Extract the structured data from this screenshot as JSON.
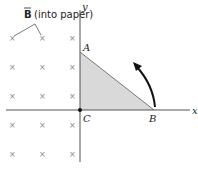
{
  "field_label": {
    "vector": "B",
    "text": "(into paper)"
  },
  "axes": {
    "x_label": "x",
    "y_label": "y"
  },
  "points": {
    "A": "A",
    "B": "B",
    "C": "C"
  },
  "field_marks": {
    "symbol": "×",
    "columns_x": [
      12,
      42,
      72
    ],
    "rows_y": [
      38,
      67,
      96,
      125,
      154
    ]
  },
  "colors": {
    "triangle_fill": "#d9d9d9",
    "axis": "#555555",
    "edge": "#777777",
    "arrow": "#111111"
  }
}
